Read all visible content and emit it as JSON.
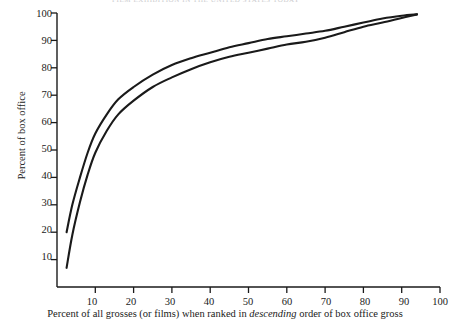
{
  "page": {
    "running_header": "FILM  EXHIBITION  IN  THE  UNITED  STATES  TODAY"
  },
  "chart_data": {
    "type": "line",
    "title": "",
    "xlabel": "Percent of all grosses (or films) when ranked in descending order of box office gross",
    "xlabel_parts": {
      "before": "Percent of all grosses (or films) when ranked in ",
      "italic": "descending",
      "after": " order of box office gross"
    },
    "ylabel": "Percent of box office",
    "xlim": [
      0,
      100
    ],
    "ylim": [
      0,
      100
    ],
    "xticks": [
      10,
      20,
      30,
      40,
      50,
      60,
      70,
      80,
      90,
      100
    ],
    "yticks": [
      10,
      20,
      30,
      40,
      50,
      60,
      70,
      80,
      90,
      100
    ],
    "grid": false,
    "legend": "none",
    "line_color": "#1a1a1a",
    "series": [
      {
        "name": "upper-curve",
        "x": [
          2.5,
          4,
          6,
          8,
          10,
          13,
          16,
          20,
          25,
          30,
          35,
          40,
          45,
          50,
          55,
          60,
          65,
          70,
          75,
          80,
          85,
          90,
          94
        ],
        "values": [
          20,
          30,
          40,
          49,
          56,
          63,
          68.5,
          73,
          77.5,
          81,
          83.5,
          85.5,
          87.5,
          89,
          90.5,
          91.5,
          92.5,
          93.5,
          95,
          96.5,
          98,
          99,
          99.5
        ]
      },
      {
        "name": "lower-curve",
        "x": [
          2.5,
          4,
          6,
          8,
          10,
          13,
          16,
          20,
          25,
          30,
          35,
          40,
          45,
          50,
          55,
          60,
          65,
          70,
          75,
          80,
          85,
          90,
          94
        ],
        "values": [
          7,
          19,
          31,
          41,
          49,
          57,
          63,
          68,
          73,
          76.5,
          79.5,
          82,
          84,
          85.5,
          87,
          88.5,
          89.5,
          91,
          93,
          95,
          96.5,
          98.2,
          99.5
        ]
      }
    ]
  }
}
